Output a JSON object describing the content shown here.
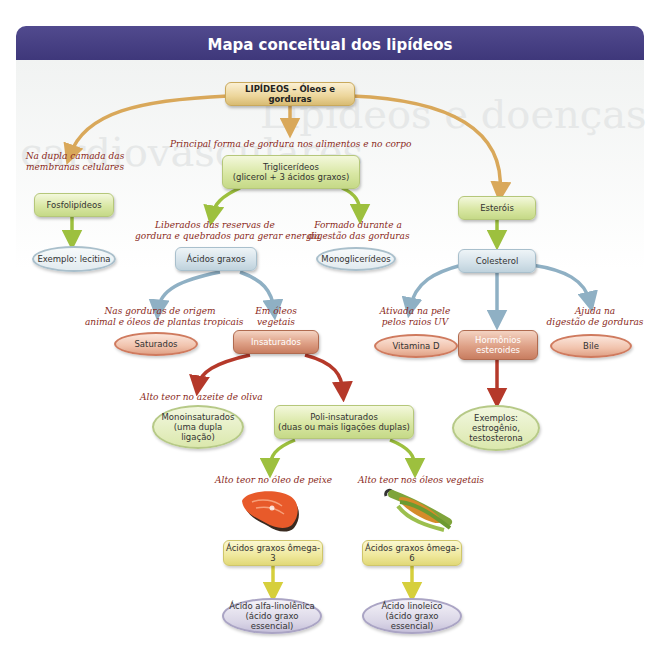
{
  "header": {
    "title": "Mapa conceitual dos lipídeos",
    "color": "#433c80"
  },
  "watermark": {
    "line1": "Lipídeos e doenças",
    "line2": "cardiovasculares"
  },
  "nodes": {
    "root": "LIPÍDEOS – Óleos e gorduras",
    "fosfolipideos": "Fosfolipídeos",
    "lecitina": "Exemplo: lecitina",
    "triglicerideos_1": "Triglicerídeos",
    "triglicerideos_2": "(glicerol + 3 ácidos graxos)",
    "acidos_graxos": "Ácidos graxos",
    "monoglicerideos": "Monoglicerídeos",
    "esterois": "Esteróis",
    "colesterol": "Colesterol",
    "saturados": "Saturados",
    "insaturados": "Insaturados",
    "vitamina_d": "Vitamina D",
    "hormonios_1": "Hormônios",
    "hormonios_2": "esteroides",
    "bile": "Bile",
    "exemplos_1": "Exemplos:",
    "exemplos_2": "estrogênio,",
    "exemplos_3": "testosterona",
    "mono_1": "Monoinsaturados",
    "mono_2": "(uma dupla",
    "mono_3": "ligação)",
    "poli_1": "Poli-insaturados",
    "poli_2": "(duas ou mais ligações duplas)",
    "omega3": "Ácidos graxos ômega-3",
    "omega6": "Ácidos graxos ômega-6",
    "alfa_1": "Ácido alfa-linolênica",
    "alfa_2": "(ácido graxo essencial)",
    "linoleico_1": "Ácido linoleico",
    "linoleico_2": "(ácido graxo essencial)"
  },
  "labels": {
    "principal": "Principal forma de gordura nos alimentos e no corpo",
    "membranas_1": "Na dupla camada das",
    "membranas_2": "membranas celulares",
    "liberados_1": "Liberados das reservas de",
    "liberados_2": "gordura e quebrados para gerar energia",
    "formado_1": "Formado durante a",
    "formado_2": "digestão das gorduras",
    "origem_1": "Nas gorduras de origem",
    "origem_2": "animal e óleos de plantas tropicais",
    "oleos_1": "Em óleos",
    "oleos_2": "vegetais",
    "ativada_1": "Ativada na pele",
    "ativada_2": "pelos raios UV",
    "ajuda_1": "Ajuda na",
    "ajuda_2": "digestão de gorduras",
    "oliva": "Alto teor no azeite de oliva",
    "peixe": "Alto teor no óleo de peixe",
    "vegetais": "Alto teor nos óleos vegetais"
  },
  "images": {
    "fish": "salmon-steak-image",
    "corn": "corn-cob-image"
  },
  "colors": {
    "gold_arrow": "#d9a85a",
    "green_arrow": "#9dc03e",
    "blue_arrow": "#8fb0c4",
    "red_arrow": "#b5392a",
    "yellow_arrow": "#d6cf3c",
    "label_text": "#8a2a22"
  }
}
